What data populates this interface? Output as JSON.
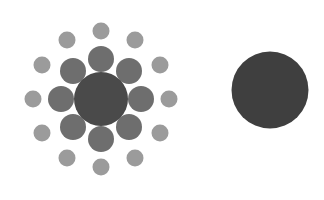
{
  "scene": {
    "title": "Ebbinghaus illusion",
    "width": 324,
    "height": 200,
    "background_color": "#ffffff"
  },
  "palette": {
    "background": "#ffffff",
    "target_left_color": "#4a4a4a",
    "target_right_color": "#3f3f3f",
    "inducer_inner_color": "#6e6e6e",
    "inducer_outer_color": "#9b9b9b"
  },
  "figures": [
    {
      "name": "left-figure",
      "label": "surrounded-target",
      "center": {
        "x": 101,
        "y": 99
      },
      "target": {
        "name": "left-target-circle",
        "cx": 101,
        "cy": 99,
        "diameter": 54,
        "radius": 27,
        "color": "#4a4a4a"
      },
      "inner_ring": {
        "name": "inner-inducer-ring",
        "count": 8,
        "diameter": 26,
        "radius": 13,
        "ring_radius": 40,
        "color": "#6e6e6e",
        "start_angle_deg": -90,
        "circles": [
          {
            "cx": 101,
            "cy": 59
          },
          {
            "cx": 129,
            "cy": 71
          },
          {
            "cx": 141,
            "cy": 99
          },
          {
            "cx": 129,
            "cy": 127
          },
          {
            "cx": 101,
            "cy": 139
          },
          {
            "cx": 73,
            "cy": 127
          },
          {
            "cx": 61,
            "cy": 99
          },
          {
            "cx": 73,
            "cy": 71
          }
        ]
      },
      "outer_ring": {
        "name": "outer-inducer-ring",
        "count": 12,
        "diameter": 17,
        "radius": 8.5,
        "ring_radius": 68,
        "color": "#9b9b9b",
        "start_angle_deg": -90,
        "circles": [
          {
            "cx": 101,
            "cy": 31
          },
          {
            "cx": 135,
            "cy": 40
          },
          {
            "cx": 160,
            "cy": 65
          },
          {
            "cx": 169,
            "cy": 99
          },
          {
            "cx": 160,
            "cy": 133
          },
          {
            "cx": 135,
            "cy": 158
          },
          {
            "cx": 101,
            "cy": 167
          },
          {
            "cx": 67,
            "cy": 158
          },
          {
            "cx": 42,
            "cy": 133
          },
          {
            "cx": 33,
            "cy": 99
          },
          {
            "cx": 42,
            "cy": 65
          },
          {
            "cx": 67,
            "cy": 40
          }
        ]
      }
    },
    {
      "name": "right-figure",
      "label": "isolated-comparison",
      "center": {
        "x": 270,
        "y": 90
      },
      "target": {
        "name": "right-target-circle",
        "cx": 270,
        "cy": 90,
        "diameter": 77,
        "radius": 38.5,
        "color": "#3f3f3f"
      },
      "inner_ring": null,
      "outer_ring": null
    }
  ]
}
